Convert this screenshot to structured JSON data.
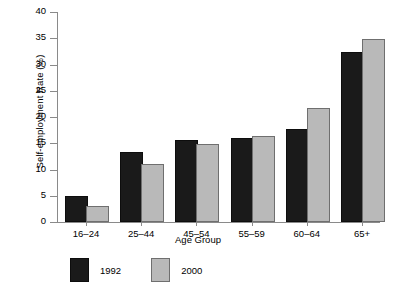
{
  "chart_data": {
    "type": "bar",
    "title": "",
    "xlabel": "Age Group",
    "ylabel": "Self-employment Rate (%)",
    "categories": [
      "16–24",
      "25–44",
      "45–54",
      "55–59",
      "60–64",
      "65+"
    ],
    "series": [
      {
        "name": "1992",
        "color": "#1a1a1a",
        "values": [
          4.6,
          13.0,
          15.3,
          15.7,
          17.3,
          32.0
        ]
      },
      {
        "name": "2000",
        "color": "#b9b9b9",
        "values": [
          2.7,
          10.7,
          14.4,
          16.0,
          21.3,
          34.5
        ]
      }
    ],
    "ylim": [
      0,
      40
    ],
    "yticks": [
      0,
      5,
      10,
      15,
      20,
      25,
      30,
      35,
      40
    ],
    "ytick_labels": [
      "0",
      "5",
      "10",
      "15",
      "20",
      "25",
      "30",
      "35",
      "40"
    ],
    "grid": false,
    "legend_position": "bottom-left"
  }
}
